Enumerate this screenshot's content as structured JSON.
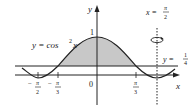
{
  "diagram": {
    "curve": {
      "equation_prefix": "y = cos",
      "exponent": "2",
      "var": "x"
    },
    "line": {
      "prefix": "y = ",
      "num": "1",
      "den": "4"
    },
    "axis_of_rotation": {
      "prefix": "x = ",
      "num": "π",
      "den": "2"
    },
    "axes": {
      "x_label": "x",
      "y_label": "y",
      "origin_label": "0",
      "y_tick_label": "1"
    },
    "x_ticks": [
      {
        "sign": "−",
        "num": "π",
        "den": "2"
      },
      {
        "sign": "−",
        "num": "π",
        "den": "3"
      },
      {
        "sign": "",
        "num": "π",
        "den": "3"
      }
    ],
    "colors": {
      "shade": "#c8c8c8",
      "stroke": "#222222"
    }
  }
}
